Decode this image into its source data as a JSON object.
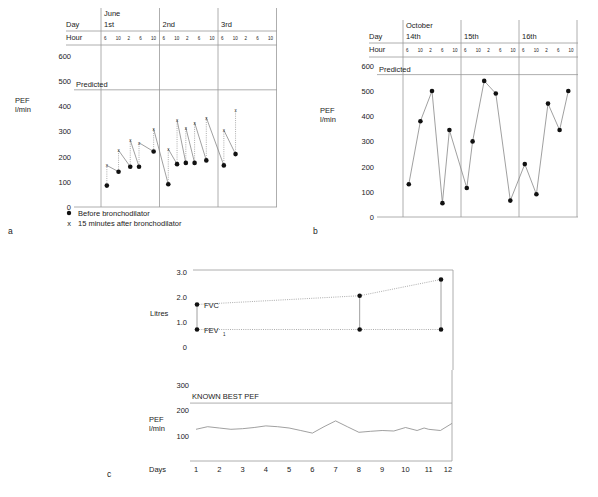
{
  "panels": {
    "a": {
      "letter": "a"
    },
    "b": {
      "letter": "b"
    },
    "c": {
      "letter": "c"
    }
  },
  "chart_data": [
    {
      "id": "a",
      "type": "scatter",
      "month_label": "June",
      "day_row_label": "Day",
      "hour_row_label": "Hour",
      "days": [
        "1st",
        "2nd",
        "3rd"
      ],
      "hours": [
        "6",
        "10",
        "2",
        "6",
        "10"
      ],
      "ylabel": "PEF l/min",
      "yticks": [
        0,
        100,
        200,
        300,
        400,
        500,
        600
      ],
      "ylim": [
        0,
        600
      ],
      "predicted_label": "Predicted",
      "predicted_value": 465,
      "legend": [
        "Before bronchodilator",
        "15 minutes after bronchodilator"
      ],
      "series": [
        {
          "name": "Before bronchodilator",
          "marker": "dot",
          "points": [
            [
              0.1,
              85
            ],
            [
              0.3,
              140
            ],
            [
              0.5,
              160
            ],
            [
              0.65,
              160
            ],
            [
              0.9,
              220
            ],
            [
              1.15,
              90
            ],
            [
              1.3,
              170
            ],
            [
              1.45,
              175
            ],
            [
              1.6,
              175
            ],
            [
              1.8,
              185
            ],
            [
              2.1,
              165
            ],
            [
              2.3,
              210
            ]
          ]
        },
        {
          "name": "15 minutes after bronchodilator",
          "marker": "x",
          "points": [
            [
              0.1,
              165
            ],
            [
              0.3,
              225
            ],
            [
              0.5,
              265
            ],
            [
              0.65,
              255
            ],
            [
              0.9,
              310
            ],
            [
              1.15,
              230
            ],
            [
              1.3,
              345
            ],
            [
              1.45,
              315
            ],
            [
              1.6,
              335
            ],
            [
              1.8,
              355
            ],
            [
              2.1,
              305
            ],
            [
              2.3,
              385
            ]
          ]
        }
      ]
    },
    {
      "id": "b",
      "type": "line",
      "month_label": "October",
      "day_row_label": "Day",
      "hour_row_label": "Hour",
      "days": [
        "14th",
        "15th",
        "16th"
      ],
      "hours": [
        "6",
        "10",
        "2",
        "6",
        "10"
      ],
      "ylabel": "PEF l/min",
      "yticks": [
        0,
        100,
        200,
        300,
        400,
        500,
        600
      ],
      "ylim": [
        0,
        600
      ],
      "predicted_label": "Predicted",
      "predicted_value": 565,
      "series": [
        {
          "name": "PEF",
          "points": [
            [
              0.1,
              130
            ],
            [
              0.3,
              380
            ],
            [
              0.5,
              500
            ],
            [
              0.68,
              55
            ],
            [
              0.8,
              345
            ],
            [
              1.1,
              115
            ],
            [
              1.2,
              300
            ],
            [
              1.4,
              540
            ],
            [
              1.6,
              490
            ],
            [
              1.85,
              65
            ],
            [
              2.1,
              210
            ],
            [
              2.3,
              90
            ],
            [
              2.5,
              450
            ],
            [
              2.7,
              345
            ],
            [
              2.85,
              500
            ]
          ]
        }
      ]
    },
    {
      "id": "c-top",
      "type": "line",
      "ylabel": "Litres",
      "yticks": [
        "0",
        "1.0",
        "2.0",
        "3.0"
      ],
      "ylim": [
        0,
        3
      ],
      "series": [
        {
          "name": "FVC",
          "label": "FVC",
          "x": [
            1,
            8,
            11.5
          ],
          "values": [
            1.7,
            2.05,
            2.7
          ]
        },
        {
          "name": "FEV1",
          "label": "FEV",
          "label_sub": "1",
          "x": [
            1,
            8,
            11.5
          ],
          "values": [
            0.7,
            0.7,
            0.7
          ]
        }
      ]
    },
    {
      "id": "c-bottom",
      "type": "line",
      "ylabel": "PEF l/min",
      "xlabel": "Days",
      "yticks": [
        "100",
        "200",
        "300"
      ],
      "ylim": [
        0,
        300
      ],
      "x_ticks": [
        "1",
        "2",
        "3",
        "4",
        "5",
        "6",
        "7",
        "8",
        "9",
        "10",
        "11",
        "12"
      ],
      "reference_label": "KNOWN BEST PEF",
      "reference_value": 228,
      "series": [
        {
          "name": "PEF",
          "x": [
            1,
            1.5,
            2,
            2.5,
            3,
            3.5,
            4,
            4.5,
            5,
            5.5,
            6,
            6.5,
            7,
            7.5,
            8,
            8.5,
            9,
            9.5,
            10,
            10.5,
            10.8,
            11,
            11.5,
            12
          ],
          "values": [
            125,
            135,
            130,
            125,
            127,
            132,
            138,
            135,
            130,
            120,
            110,
            135,
            158,
            135,
            113,
            117,
            120,
            118,
            132,
            120,
            130,
            125,
            120,
            148
          ]
        }
      ]
    }
  ]
}
